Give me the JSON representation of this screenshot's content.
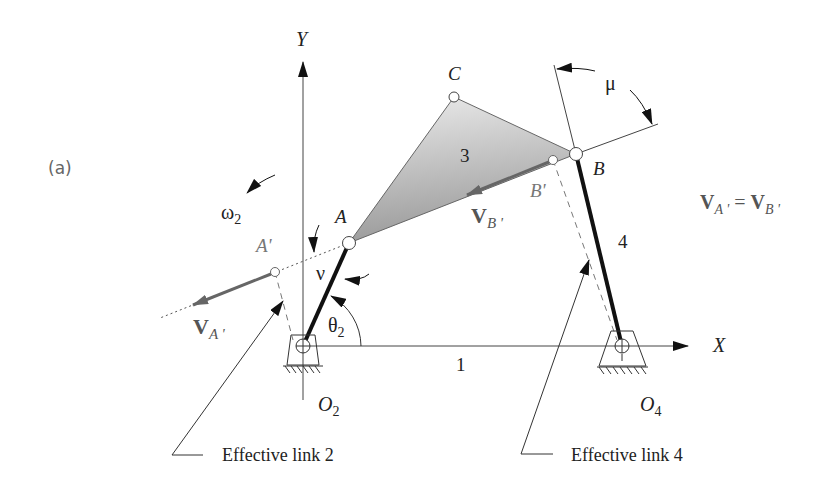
{
  "figure": {
    "panel_label": "(a)",
    "axes": {
      "x_label": "X",
      "y_label": "Y"
    },
    "points": {
      "O2": "O",
      "O2_sub": "2",
      "O4": "O",
      "O4_sub": "4",
      "A": "A",
      "B": "B",
      "C": "C",
      "A_prime": "A",
      "A_prime_mark": "'",
      "B_prime": "B",
      "B_prime_mark": "'"
    },
    "links": {
      "ground": "1",
      "coupler": "3",
      "rocker": "4"
    },
    "angles": {
      "omega": "ω",
      "omega_sub": "2",
      "theta": "θ",
      "theta_sub": "2",
      "nu": "ν",
      "mu": "μ"
    },
    "vectors": {
      "VA_prime": "V",
      "VA_prime_sub": "A '",
      "VB_prime": "V",
      "VB_prime_sub": "B '",
      "equation_lhs": "V",
      "equation_lhs_sub": "A '",
      "equation_eq": " = ",
      "equation_rhs": "V",
      "equation_rhs_sub": "B '"
    },
    "callouts": {
      "effective_link_2": "Effective link 2",
      "effective_link_4": "Effective link 4"
    },
    "colors": {
      "link_black": "#111111",
      "vector_grey": "#666666",
      "coupler_fill_light": "#e6e6e6",
      "coupler_fill_dark": "#9a9a9a"
    }
  }
}
